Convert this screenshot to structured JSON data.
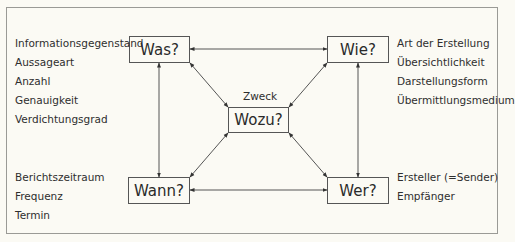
{
  "diagram": {
    "nodes": {
      "was": "Was?",
      "wie": "Wie?",
      "wozu": "Wozu?",
      "wann": "Wann?",
      "wer": "Wer?"
    },
    "center_caption": "Zweck",
    "lists": {
      "was": [
        "Informationsgegenstand",
        "Aussageart",
        "Anzahl",
        "Genauigkeit",
        "Verdichtungsgrad"
      ],
      "wie": [
        "Art der Erstellung",
        "Übersichtlichkeit",
        "Darstellungsform",
        "Übermittlungsmedium"
      ],
      "wann": [
        "Berichtszeitraum",
        "Frequenz",
        "Termin"
      ],
      "wer": [
        "Ersteller (=Sender)",
        "Empfänger"
      ]
    },
    "connections": [
      [
        "Was?",
        "Wie?"
      ],
      [
        "Wann?",
        "Wer?"
      ],
      [
        "Was?",
        "Wann?"
      ],
      [
        "Wie?",
        "Wer?"
      ],
      [
        "Was?",
        "Wozu?"
      ],
      [
        "Wie?",
        "Wozu?"
      ],
      [
        "Wann?",
        "Wozu?"
      ],
      [
        "Wer?",
        "Wozu?"
      ]
    ]
  }
}
